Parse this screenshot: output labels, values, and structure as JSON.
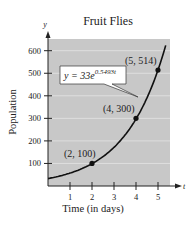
{
  "chart_data": {
    "type": "line",
    "title": "Fruit Flies",
    "xlabel": "Time (in days)",
    "ylabel": "Population",
    "x_axis_var": "t",
    "y_axis_var": "y",
    "xlim": [
      0,
      5.5
    ],
    "ylim": [
      0,
      650
    ],
    "x_ticks": [
      1,
      2,
      3,
      4,
      5
    ],
    "y_ticks": [
      100,
      200,
      300,
      400,
      500,
      600
    ],
    "grid": "horizontal",
    "equation": "y = 33e^{0.5493t}",
    "equation_base": "y = 33e",
    "equation_exponent": "0.5493t",
    "series": [
      {
        "name": "y = 33e^(0.5493t)",
        "function": {
          "a": 33,
          "k": 0.5493
        },
        "x": [
          0,
          0.5,
          1,
          1.5,
          2,
          2.5,
          3,
          3.5,
          4,
          4.5,
          5,
          5.3
        ],
        "y": [
          33,
          43.7,
          57.9,
          75.4,
          99.0,
          130.4,
          171.4,
          225.6,
          296.8,
          390.4,
          513.6,
          604
        ]
      }
    ],
    "points": [
      {
        "x": 2,
        "y": 100,
        "label": "(2, 100)"
      },
      {
        "x": 4,
        "y": 300,
        "label": "(4, 300)"
      },
      {
        "x": 5,
        "y": 514,
        "label": "(5, 514)"
      }
    ],
    "colors": {
      "plot_bg": "#c8c8c8",
      "curve": "#111111",
      "grid": "#e4e4e4"
    }
  }
}
